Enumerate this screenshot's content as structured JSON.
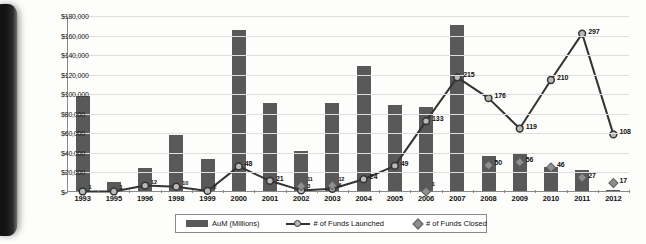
{
  "chart_data": {
    "type": "bar",
    "title": "",
    "xlabel": "",
    "ylabel": "",
    "grid": true,
    "legend_position": "bottom",
    "categories": [
      "1993",
      "1995",
      "1996",
      "1998",
      "1999",
      "2000",
      "2001",
      "2002",
      "2003",
      "2004",
      "2005",
      "2006",
      "2007",
      "2008",
      "2009",
      "2010",
      "2011",
      "2012"
    ],
    "ylim": [
      0,
      180000
    ],
    "ytick_labels": [
      "$180,000",
      "$160,000",
      "$140,000",
      "$120,000",
      "$100,000",
      "$80,000",
      "$60,000",
      "$40,000",
      "$20,000",
      "$-"
    ],
    "ytick_values": [
      180000,
      160000,
      140000,
      120000,
      100000,
      80000,
      60000,
      40000,
      20000,
      0
    ],
    "series": [
      {
        "name": "AuM (Millions)",
        "type": "bar",
        "color": "#595959",
        "values": [
          97000,
          9500,
          24000,
          57000,
          33000,
          165000,
          90000,
          41000,
          90000,
          128000,
          88000,
          86000,
          170000,
          36000,
          38000,
          25000,
          21000,
          1500
        ]
      },
      {
        "name": "# of Funds Launched",
        "type": "line",
        "color": "#333333",
        "marker_fill": "#b9b9b9",
        "values": [
          1,
          1,
          12,
          10,
          2,
          48,
          21,
          3,
          6,
          24,
          49,
          133,
          215,
          176,
          119,
          210,
          297,
          108
        ]
      },
      {
        "name": "# of Funds Closed",
        "type": "scatter",
        "color": "#8f8f8f",
        "values": [
          null,
          null,
          null,
          null,
          null,
          null,
          null,
          11,
          12,
          null,
          null,
          1,
          null,
          50,
          56,
          46,
          27,
          17
        ]
      }
    ],
    "launched_labels": [
      "1",
      "1",
      "12",
      "10",
      "2",
      "48",
      "21",
      "3",
      "6",
      "24",
      "49",
      "133",
      "215",
      "176",
      "119",
      "210",
      "297",
      "108"
    ],
    "closed_labels": [
      "",
      "",
      "",
      "",
      "",
      "",
      "",
      "11",
      "12",
      "",
      "",
      "1",
      "",
      "50",
      "56",
      "46",
      "27",
      "17"
    ]
  },
  "legend": {
    "items": [
      {
        "label": "AuM (Millions)",
        "marker": "bar-swatch"
      },
      {
        "label": "# of Funds Launched",
        "marker": "line-marker-swatch"
      },
      {
        "label": "# of Funds Closed",
        "marker": "diamond-swatch"
      }
    ]
  }
}
